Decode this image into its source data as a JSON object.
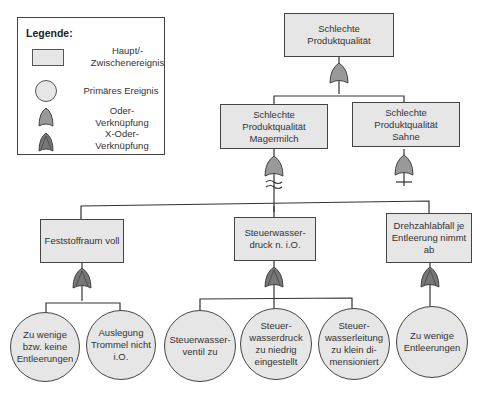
{
  "legend": {
    "title": "Legende:",
    "items": [
      {
        "shape": "rectangle",
        "label": "Haupt/-\nZwischenereignis"
      },
      {
        "shape": "circle",
        "label": "Primäres Ereignis"
      },
      {
        "shape": "or-gate",
        "label": "Oder-\nVerknüpfung"
      },
      {
        "shape": "xor-gate",
        "label": "X-Oder-\nVerknüpfung"
      }
    ]
  },
  "colors": {
    "event_fill": "#e6e6e6",
    "or_gate": "#999999",
    "xor_gate": "#777777",
    "line": "#333333"
  },
  "tree": {
    "top": {
      "label": "Schlechte\nProduktqualität",
      "gate": "or"
    },
    "level1": [
      {
        "label": "Schlechte\nProduktqualität\nMagermilch",
        "gate": "or"
      },
      {
        "label": "Schlechte\nProduktqualität\nSahne",
        "gate": "or"
      }
    ],
    "level2": [
      {
        "label": "Feststoffraum voll",
        "gate": "xor"
      },
      {
        "label": "Steuerwasser-\ndruck n. i.O.",
        "gate": "xor"
      },
      {
        "label": "Drehzahlabfall je\nEntleerung nimmt\nab",
        "gate": "xor"
      }
    ],
    "primary": [
      {
        "label": "Zu wenige\nbzw. keine\nEntleerungen"
      },
      {
        "label": "Auslegung\nTrommel nicht\ni.O."
      },
      {
        "label": "Steuerwasser-\nventil zu"
      },
      {
        "label": "Steuer-\nwasserdruck\nzu niedrig\neingestellt"
      },
      {
        "label": "Steuer-\nwasserleitung\nzu klein di-\nmensioniert"
      },
      {
        "label": "Zu wenige\nEntleerungen"
      }
    ]
  }
}
